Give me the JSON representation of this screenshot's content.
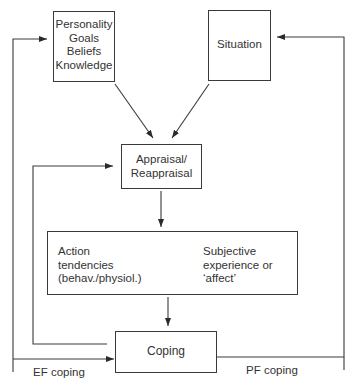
{
  "diagram": {
    "nodes": {
      "personality": {
        "lines": [
          "Personality",
          "Goals",
          "Beliefs",
          "Knowledge"
        ]
      },
      "situation": {
        "label": "Situation"
      },
      "appraisal": {
        "lines": [
          "Appraisal/",
          "Reappraisal"
        ]
      },
      "action": {
        "lines": [
          "Action",
          "tendencies",
          "(behav./physiol.)"
        ]
      },
      "affect": {
        "lines": [
          "Subjective",
          "experience or",
          "‘affect’"
        ]
      },
      "coping": {
        "label": "Coping"
      }
    },
    "edges": {
      "ef_label": "EF coping",
      "pf_label": "PF coping"
    },
    "colors": {
      "stroke": "#3a3a3a",
      "text": "#333333",
      "background": "#ffffff"
    }
  }
}
